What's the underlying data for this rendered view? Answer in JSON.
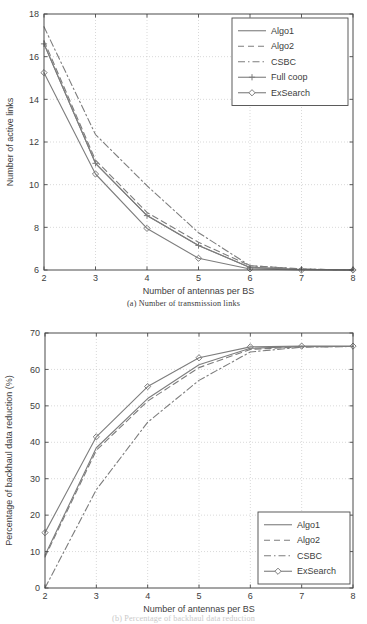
{
  "figure": {
    "panels": [
      {
        "id": "a",
        "caption": "(a)  Number of transmission links",
        "xlabel": "Number of antennas per BS",
        "ylabel": "Number of active links"
      },
      {
        "id": "b",
        "caption": "(b)  Percentage of backhaul data reduction",
        "xlabel": "Number of antennas per BS",
        "ylabel": "Percentage of backhaul data reduction (%)"
      }
    ]
  },
  "colors": {
    "line": "#7d7d7d",
    "axis": "#4a4a4a",
    "grid": "#c8c8c8",
    "text": "#3d3d3d",
    "background": "#ffffff"
  },
  "chart_data": [
    {
      "type": "line",
      "title": "(a)  Number of transmission links",
      "xlabel": "Number of antennas per BS",
      "ylabel": "Number of active links",
      "x": [
        2,
        3,
        4,
        5,
        6,
        7,
        8
      ],
      "xlim": [
        2,
        8
      ],
      "ylim": [
        6,
        18
      ],
      "xticks": [
        2,
        3,
        4,
        5,
        6,
        7,
        8
      ],
      "yticks": [
        6,
        8,
        10,
        12,
        14,
        16,
        18
      ],
      "xticklabels": [
        "2",
        "3",
        "4",
        "5",
        "6",
        "7",
        "8"
      ],
      "yticklabels": [
        "6",
        "8",
        "10",
        "12",
        "14",
        "16",
        "18"
      ],
      "grid": true,
      "legend_position": "upper right",
      "series": [
        {
          "name": "Algo1",
          "style": "solid",
          "marker": "none",
          "values": [
            16.6,
            11.0,
            8.55,
            7.15,
            6.12,
            6.02,
            6.0
          ]
        },
        {
          "name": "Algo2",
          "style": "dashed",
          "marker": "none",
          "values": [
            16.75,
            11.15,
            8.7,
            7.3,
            6.2,
            6.05,
            6.0
          ]
        },
        {
          "name": "CSBC",
          "style": "dashdot",
          "marker": "none",
          "values": [
            17.4,
            12.35,
            9.95,
            7.75,
            6.2,
            6.05,
            6.0
          ]
        },
        {
          "name": "Full coop",
          "style": "solid",
          "marker": "plus",
          "values": [
            16.6,
            11.0,
            8.55,
            7.15,
            6.12,
            6.02,
            6.0
          ]
        },
        {
          "name": "ExSearch",
          "style": "solid",
          "marker": "diamond",
          "values": [
            15.25,
            10.5,
            7.95,
            6.55,
            6.05,
            6.0,
            6.0
          ]
        }
      ]
    },
    {
      "type": "line",
      "title": "(b)  Percentage of backhaul data reduction",
      "xlabel": "Number of antennas per BS",
      "ylabel": "Percentage of backhaul data reduction (%)",
      "x": [
        2,
        3,
        4,
        5,
        6,
        7,
        8
      ],
      "xlim": [
        2,
        8
      ],
      "ylim": [
        0,
        70
      ],
      "xticks": [
        2,
        3,
        4,
        5,
        6,
        7,
        8
      ],
      "yticks": [
        0,
        10,
        20,
        30,
        40,
        50,
        60,
        70
      ],
      "xticklabels": [
        "2",
        "3",
        "4",
        "5",
        "6",
        "7",
        "8"
      ],
      "yticklabels": [
        "0",
        "10",
        "20",
        "30",
        "40",
        "50",
        "60",
        "70"
      ],
      "grid": true,
      "legend_position": "lower right",
      "series": [
        {
          "name": "Algo1",
          "style": "solid",
          "marker": "none",
          "values": [
            9.0,
            38.5,
            52.0,
            61.3,
            65.8,
            66.3,
            66.3
          ]
        },
        {
          "name": "Algo2",
          "style": "dashed",
          "marker": "none",
          "values": [
            8.5,
            37.8,
            51.3,
            60.5,
            65.5,
            66.2,
            66.3
          ]
        },
        {
          "name": "CSBC",
          "style": "dashdot",
          "marker": "none",
          "values": [
            0.0,
            27.0,
            45.5,
            57.0,
            64.8,
            66.1,
            66.3
          ]
        },
        {
          "name": "ExSearch",
          "style": "solid",
          "marker": "diamond",
          "values": [
            15.2,
            41.5,
            55.3,
            63.2,
            66.2,
            66.4,
            66.4
          ]
        }
      ]
    }
  ]
}
